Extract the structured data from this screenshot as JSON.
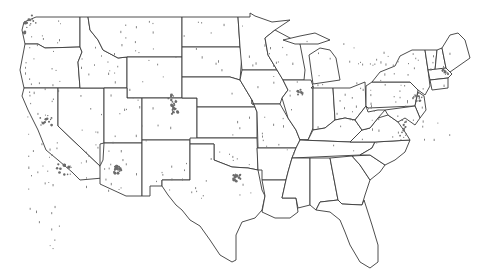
{
  "map": {
    "title": "",
    "region": "Contiguous United States",
    "projection": "Albers-like (state outlines)",
    "colors": {
      "background": "#ffffff",
      "state_fill": "#ffffff",
      "state_border": "#3a3a3a",
      "point_color": "#777777"
    },
    "layers": [
      {
        "name": "state-boundaries",
        "type": "polygon"
      },
      {
        "name": "points",
        "type": "scatter",
        "description": "small gray urban/area markers"
      }
    ],
    "states": [
      {
        "id": "WA",
        "d": "M36,17 L80,17 L80,47 L45,48 L38,44 L25,44 L22,30 L24,22 Z"
      },
      {
        "id": "OR",
        "d": "M25,44 L38,44 L45,48 L80,47 L82,52 L78,62 L80,88 L24,88 L20,70 Z"
      },
      {
        "id": "CA",
        "d": "M24,88 L58,88 L58,126 L100,166 L103,178 L80,180 L72,172 L58,160 L46,150 L38,130 L28,110 L22,96 Z"
      },
      {
        "id": "NV",
        "d": "M58,88 L104,88 L104,143 L100,144 L100,166 L58,126 Z"
      },
      {
        "id": "ID",
        "d": "M80,17 L88,17 L90,30 L98,40 L103,50 L118,58 L127,57 L127,88 L80,88 L78,62 L82,52 L80,47 Z"
      },
      {
        "id": "MT",
        "d": "M88,17 L182,17 L182,57 L127,57 L118,58 L103,50 L98,40 L90,30 Z"
      },
      {
        "id": "WY",
        "d": "M127,57 L182,57 L182,98 L127,98 Z"
      },
      {
        "id": "UT",
        "d": "M104,88 L127,88 L127,98 L142,98 L142,143 L104,143 Z"
      },
      {
        "id": "CO",
        "d": "M142,98 L197,98 L197,140 L142,140 Z"
      },
      {
        "id": "AZ",
        "d": "M104,143 L142,143 L142,196 L126,196 L100,184 L100,166 L103,160 Z"
      },
      {
        "id": "NM",
        "d": "M142,140 L190,140 L190,180 L162,180 L162,186 L150,186 L150,196 L142,196 Z"
      },
      {
        "id": "ND",
        "d": "M182,17 L238,17 L240,47 L182,47 Z"
      },
      {
        "id": "SD",
        "d": "M182,47 L240,47 L242,55 L240,80 L230,77 L182,77 Z"
      },
      {
        "id": "NE",
        "d": "M182,77 L230,77 L240,80 L252,100 L255,107 L197,107 L197,98 L182,98 Z"
      },
      {
        "id": "KS",
        "d": "M197,107 L255,107 L257,112 L257,138 L197,138 Z"
      },
      {
        "id": "OK",
        "d": "M190,138 L257,138 L258,170 L248,168 L232,167 L214,160 L214,144 L190,144 Z"
      },
      {
        "id": "TX",
        "d": "M162,180 L190,180 L190,144 L214,144 L214,160 L232,167 L248,168 L258,170 L262,190 L265,196 L262,210 L255,218 L242,222 L236,235 L236,260 L232,262 L220,255 L210,240 L200,226 L190,220 L182,210 L176,205 L168,195 L162,186 Z"
      },
      {
        "id": "MN",
        "d": "M238,17 L250,17 L250,13 L255,16 L272,22 L290,20 L275,30 L265,38 L268,55 L277,70 L242,70 L240,47 Z"
      },
      {
        "id": "IA",
        "d": "M242,70 L277,70 L282,78 L288,90 L282,98 L280,104 L252,104 L252,100 L240,80 Z"
      },
      {
        "id": "MO",
        "d": "M252,100 L252,104 L280,104 L288,118 L296,130 L300,140 L296,148 L258,148 L257,112 L255,107 Z"
      },
      {
        "id": "AR",
        "d": "M257,148 L296,148 L292,158 L288,172 L286,180 L262,180 L262,170 L258,170 Z"
      },
      {
        "id": "LA",
        "d": "M262,180 L286,180 L282,198 L296,198 L298,212 L290,218 L275,218 L262,212 L265,196 Z"
      },
      {
        "id": "WI",
        "d": "M265,38 L275,30 L290,38 L300,44 L305,70 L304,80 L283,80 L277,70 L268,55 Z"
      },
      {
        "id": "IL",
        "d": "M283,80 L311,80 L313,86 L313,128 L308,140 L300,140 L296,130 L288,118 L282,98 L288,90 Z"
      },
      {
        "id": "MI",
        "d": "M309,55 L320,48 L330,50 L336,58 L340,80 L313,84 L311,70 Z"
      },
      {
        "id": "MI-UP",
        "d": "M283,40 L300,36 L315,33 L330,40 L318,44 L305,44 L295,44 Z"
      },
      {
        "id": "IN",
        "d": "M311,88 L333,88 L335,120 L325,128 L313,130 L313,86 Z"
      },
      {
        "id": "OH",
        "d": "M333,88 L350,88 L365,82 L366,106 L355,120 L345,118 L335,120 Z"
      },
      {
        "id": "KY",
        "d": "M300,140 L308,140 L313,130 L325,128 L335,120 L345,118 L355,120 L362,130 L350,142 Z"
      },
      {
        "id": "TN",
        "d": "M296,148 L300,140 L350,142 L375,142 L372,148 L360,155 L292,158 Z"
      },
      {
        "id": "MS",
        "d": "M292,158 L310,158 L310,205 L298,208 L296,198 L282,198 L286,180 L288,172 Z"
      },
      {
        "id": "AL",
        "d": "M310,158 L330,158 L338,200 L320,202 L316,210 L310,205 Z"
      },
      {
        "id": "GA",
        "d": "M330,158 L352,156 L360,165 L370,180 L365,195 L362,205 L342,204 L338,200 Z"
      },
      {
        "id": "FL",
        "d": "M316,210 L320,202 L338,200 L342,204 L362,205 L364,200 L372,225 L378,245 L378,262 L370,268 L360,262 L350,245 L345,232 L340,220 L330,212 Z"
      },
      {
        "id": "SC",
        "d": "M352,156 L370,155 L385,165 L380,172 L370,180 L360,165 Z"
      },
      {
        "id": "NC",
        "d": "M360,155 L372,148 L375,142 L410,140 L405,152 L395,160 L385,165 L370,155 Z"
      },
      {
        "id": "VA",
        "d": "M350,142 L362,130 L370,128 L378,118 L388,115 L398,122 L405,132 L410,140 L375,142 Z"
      },
      {
        "id": "WV",
        "d": "M355,120 L366,106 L368,112 L378,110 L385,110 L378,118 L370,128 L362,130 Z"
      },
      {
        "id": "PA",
        "d": "M366,86 L372,82 L410,82 L418,90 L415,106 L368,108 L366,106 Z"
      },
      {
        "id": "NY",
        "d": "M372,82 L380,72 L395,66 L400,56 L412,50 L425,50 L428,70 L430,86 L425,95 L418,90 L410,82 Z"
      },
      {
        "id": "NJ",
        "d": "M415,106 L418,92 L424,96 L426,110 L420,118 Z"
      },
      {
        "id": "MD-DE",
        "d": "M385,110 L415,106 L420,118 L415,125 L405,118 L398,122 L388,115 Z"
      },
      {
        "id": "VT",
        "d": "M425,50 L437,50 L435,70 L428,70 Z"
      },
      {
        "id": "NH",
        "d": "M437,50 L442,48 L446,68 L435,70 Z"
      },
      {
        "id": "ME",
        "d": "M442,48 L450,35 L458,33 L465,40 L470,58 L460,65 L450,72 L446,68 Z"
      },
      {
        "id": "MA",
        "d": "M428,70 L446,68 L452,74 L448,78 L430,80 Z"
      },
      {
        "id": "CT-RI",
        "d": "M430,80 L448,78 L448,88 L432,90 Z"
      }
    ],
    "point_count_estimate": "several hundred",
    "dense_clusters": [
      "Seattle",
      "San Francisco Bay",
      "Los Angeles",
      "Phoenix",
      "Denver",
      "Dallas",
      "Houston",
      "Chicago",
      "Detroit",
      "New York",
      "Boston",
      "Chesapeake Bay"
    ]
  }
}
